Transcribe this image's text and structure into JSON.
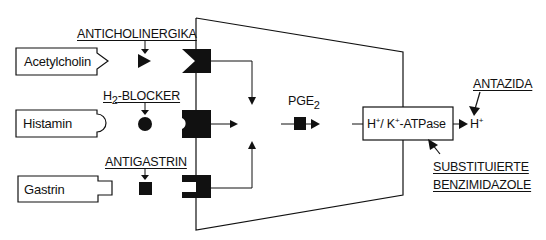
{
  "diagram": {
    "title": "",
    "ligands": [
      {
        "id": "acetylcholin",
        "label": "Acetylcholin",
        "shape": "arrow-tip"
      },
      {
        "id": "histamin",
        "label": "Histamin",
        "shape": "round-tab"
      },
      {
        "id": "gastrin",
        "label": "Gastrin",
        "shape": "square-tab"
      }
    ],
    "antagonists": [
      {
        "id": "anticholinergika",
        "label": "ANTICHOLINERGIKA",
        "blocker_shape": "triangle"
      },
      {
        "id": "h2-blocker",
        "label_main": "H",
        "label_sub": "2",
        "label_rest": "-BLOCKER",
        "blocker_shape": "circle"
      },
      {
        "id": "antigastrin",
        "label": "ANTIGASTRIN",
        "blocker_shape": "square"
      }
    ],
    "pge2": {
      "label_main": "PGE",
      "label_sub": "2"
    },
    "atpase": {
      "h": "H",
      "plus1": "+",
      "slash_k": "/ K",
      "plus2": "+",
      "rest": "-ATPase"
    },
    "output": {
      "h": "H",
      "plus": "+"
    },
    "antazida": {
      "label": "ANTAZIDA"
    },
    "benzimidazole": {
      "line1": "SUBSTITUIERTE",
      "line2": "BENZIMIDAZOLE"
    },
    "colors": {
      "ink": "#111111",
      "background": "#ffffff"
    }
  }
}
